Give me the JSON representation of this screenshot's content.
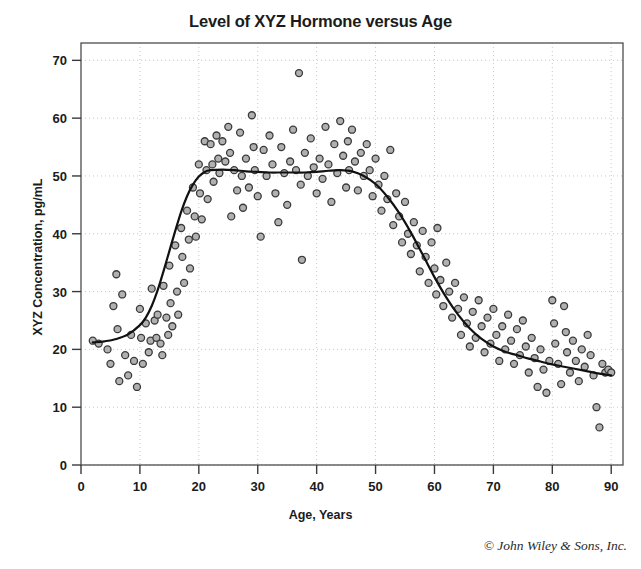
{
  "chart_data": {
    "type": "scatter",
    "title": "Level of XYZ Hormone versus Age",
    "xlabel": "Age, Years",
    "ylabel": "XYZ Concentration, pg/mL",
    "xlim": [
      0,
      92
    ],
    "ylim": [
      0,
      73
    ],
    "xticks": [
      0,
      10,
      20,
      30,
      40,
      50,
      60,
      70,
      80,
      90
    ],
    "yticks": [
      0,
      10,
      20,
      30,
      40,
      50,
      60,
      70
    ],
    "grid": true,
    "legend": "none",
    "marker": {
      "shape": "circle",
      "fill_color": "#b0b0b0",
      "edge_color": "#3a3a3a",
      "size_px": 7
    },
    "series": [
      {
        "name": "XYZ Hormone measurements",
        "type": "scatter",
        "points": [
          [
            2.0,
            21.5
          ],
          [
            3.0,
            21.0
          ],
          [
            4.5,
            20.0
          ],
          [
            5.0,
            17.5
          ],
          [
            5.5,
            27.5
          ],
          [
            6.0,
            33.0
          ],
          [
            6.2,
            23.5
          ],
          [
            6.5,
            14.5
          ],
          [
            7.0,
            29.5
          ],
          [
            7.5,
            19.0
          ],
          [
            8.0,
            15.5
          ],
          [
            8.5,
            22.5
          ],
          [
            9.0,
            18.0
          ],
          [
            9.5,
            13.5
          ],
          [
            10.0,
            27.0
          ],
          [
            10.2,
            22.0
          ],
          [
            10.5,
            17.5
          ],
          [
            11.0,
            24.5
          ],
          [
            11.5,
            19.5
          ],
          [
            11.8,
            21.5
          ],
          [
            12.0,
            30.5
          ],
          [
            12.5,
            25.0
          ],
          [
            12.8,
            22.0
          ],
          [
            13.0,
            26.0
          ],
          [
            13.5,
            21.0
          ],
          [
            13.8,
            19.0
          ],
          [
            14.0,
            31.0
          ],
          [
            14.5,
            25.5
          ],
          [
            14.8,
            22.5
          ],
          [
            15.0,
            34.5
          ],
          [
            15.2,
            28.0
          ],
          [
            15.5,
            24.0
          ],
          [
            16.0,
            38.0
          ],
          [
            16.3,
            30.0
          ],
          [
            16.5,
            26.0
          ],
          [
            17.0,
            41.0
          ],
          [
            17.2,
            36.0
          ],
          [
            17.5,
            31.5
          ],
          [
            18.0,
            44.0
          ],
          [
            18.3,
            39.0
          ],
          [
            18.5,
            34.0
          ],
          [
            19.0,
            48.0
          ],
          [
            19.3,
            43.0
          ],
          [
            19.5,
            39.5
          ],
          [
            20.0,
            52.0
          ],
          [
            20.2,
            47.0
          ],
          [
            20.5,
            42.5
          ],
          [
            21.0,
            56.0
          ],
          [
            21.3,
            51.0
          ],
          [
            21.5,
            46.0
          ],
          [
            22.0,
            55.5
          ],
          [
            22.3,
            52.0
          ],
          [
            22.5,
            49.0
          ],
          [
            23.0,
            57.0
          ],
          [
            23.3,
            53.0
          ],
          [
            23.5,
            50.5
          ],
          [
            24.0,
            56.0
          ],
          [
            24.5,
            52.5
          ],
          [
            25.0,
            58.5
          ],
          [
            25.3,
            54.0
          ],
          [
            25.5,
            43.0
          ],
          [
            26.0,
            51.0
          ],
          [
            26.5,
            47.5
          ],
          [
            27.0,
            57.5
          ],
          [
            27.3,
            50.0
          ],
          [
            27.5,
            44.5
          ],
          [
            28.0,
            53.0
          ],
          [
            28.5,
            48.0
          ],
          [
            29.0,
            60.5
          ],
          [
            29.3,
            55.0
          ],
          [
            29.5,
            51.0
          ],
          [
            30.0,
            46.5
          ],
          [
            30.5,
            39.5
          ],
          [
            31.0,
            54.5
          ],
          [
            31.5,
            50.0
          ],
          [
            32.0,
            57.0
          ],
          [
            32.5,
            52.0
          ],
          [
            33.0,
            47.0
          ],
          [
            33.5,
            42.0
          ],
          [
            34.0,
            55.0
          ],
          [
            34.5,
            50.5
          ],
          [
            35.0,
            45.0
          ],
          [
            35.5,
            52.5
          ],
          [
            36.0,
            58.0
          ],
          [
            36.5,
            51.0
          ],
          [
            37.0,
            67.8
          ],
          [
            37.3,
            48.5
          ],
          [
            37.5,
            35.5
          ],
          [
            38.0,
            54.0
          ],
          [
            38.5,
            50.0
          ],
          [
            39.0,
            56.5
          ],
          [
            39.5,
            51.5
          ],
          [
            40.0,
            47.0
          ],
          [
            40.5,
            53.0
          ],
          [
            41.0,
            49.5
          ],
          [
            41.5,
            58.5
          ],
          [
            42.0,
            52.0
          ],
          [
            42.5,
            45.5
          ],
          [
            43.0,
            55.5
          ],
          [
            43.5,
            50.5
          ],
          [
            44.0,
            59.5
          ],
          [
            44.5,
            53.5
          ],
          [
            45.0,
            48.0
          ],
          [
            45.3,
            56.0
          ],
          [
            45.5,
            51.0
          ],
          [
            46.0,
            58.0
          ],
          [
            46.5,
            52.5
          ],
          [
            47.0,
            47.5
          ],
          [
            47.5,
            54.0
          ],
          [
            48.0,
            50.0
          ],
          [
            48.5,
            55.5
          ],
          [
            49.0,
            51.0
          ],
          [
            49.5,
            46.5
          ],
          [
            50.0,
            53.0
          ],
          [
            50.5,
            48.5
          ],
          [
            51.0,
            44.0
          ],
          [
            51.5,
            50.0
          ],
          [
            52.0,
            46.0
          ],
          [
            52.5,
            54.5
          ],
          [
            53.0,
            41.5
          ],
          [
            53.5,
            47.0
          ],
          [
            54.0,
            43.0
          ],
          [
            54.5,
            38.5
          ],
          [
            55.0,
            45.5
          ],
          [
            55.5,
            40.0
          ],
          [
            56.0,
            36.5
          ],
          [
            56.5,
            42.0
          ],
          [
            57.0,
            38.0
          ],
          [
            57.5,
            33.5
          ],
          [
            58.0,
            40.5
          ],
          [
            58.5,
            36.0
          ],
          [
            59.0,
            31.5
          ],
          [
            59.5,
            38.5
          ],
          [
            60.0,
            34.0
          ],
          [
            60.3,
            29.5
          ],
          [
            60.5,
            41.0
          ],
          [
            61.0,
            32.0
          ],
          [
            61.5,
            27.5
          ],
          [
            62.0,
            35.0
          ],
          [
            62.5,
            30.0
          ],
          [
            63.0,
            25.5
          ],
          [
            63.5,
            31.5
          ],
          [
            64.0,
            27.0
          ],
          [
            64.5,
            22.5
          ],
          [
            65.0,
            29.0
          ],
          [
            65.5,
            24.5
          ],
          [
            66.0,
            20.5
          ],
          [
            66.5,
            26.5
          ],
          [
            67.0,
            22.0
          ],
          [
            67.5,
            28.5
          ],
          [
            68.0,
            24.0
          ],
          [
            68.5,
            19.5
          ],
          [
            69.0,
            25.5
          ],
          [
            69.5,
            21.0
          ],
          [
            70.0,
            27.0
          ],
          [
            70.5,
            22.5
          ],
          [
            71.0,
            18.0
          ],
          [
            71.5,
            24.0
          ],
          [
            72.0,
            20.0
          ],
          [
            72.5,
            26.0
          ],
          [
            73.0,
            21.5
          ],
          [
            73.5,
            17.5
          ],
          [
            74.0,
            23.5
          ],
          [
            74.5,
            19.0
          ],
          [
            75.0,
            25.0
          ],
          [
            75.5,
            20.5
          ],
          [
            76.0,
            16.0
          ],
          [
            76.5,
            22.0
          ],
          [
            77.0,
            18.5
          ],
          [
            77.5,
            13.5
          ],
          [
            78.0,
            20.0
          ],
          [
            78.5,
            16.5
          ],
          [
            79.0,
            12.5
          ],
          [
            79.5,
            18.0
          ],
          [
            80.0,
            28.5
          ],
          [
            80.3,
            24.5
          ],
          [
            80.5,
            21.0
          ],
          [
            81.0,
            17.5
          ],
          [
            81.5,
            14.0
          ],
          [
            82.0,
            27.5
          ],
          [
            82.3,
            23.0
          ],
          [
            82.5,
            19.5
          ],
          [
            83.0,
            16.0
          ],
          [
            83.5,
            21.5
          ],
          [
            84.0,
            18.0
          ],
          [
            84.5,
            14.5
          ],
          [
            85.0,
            20.0
          ],
          [
            85.5,
            17.0
          ],
          [
            86.0,
            22.5
          ],
          [
            86.5,
            19.0
          ],
          [
            87.0,
            15.5
          ],
          [
            87.5,
            10.0
          ],
          [
            88.0,
            6.5
          ],
          [
            88.5,
            17.5
          ],
          [
            89.0,
            16.0
          ],
          [
            89.5,
            16.5
          ],
          [
            90.0,
            16.0
          ]
        ]
      },
      {
        "name": "Fitted trend curve",
        "type": "line",
        "color": "#111111",
        "width_px": 2.2,
        "points": [
          [
            2.0,
            21.2
          ],
          [
            4.0,
            21.4
          ],
          [
            6.0,
            21.8
          ],
          [
            8.0,
            22.6
          ],
          [
            10.0,
            24.2
          ],
          [
            11.0,
            25.5
          ],
          [
            12.0,
            27.5
          ],
          [
            13.0,
            30.2
          ],
          [
            14.0,
            33.5
          ],
          [
            15.0,
            37.0
          ],
          [
            16.0,
            40.5
          ],
          [
            17.0,
            43.8
          ],
          [
            18.0,
            46.5
          ],
          [
            19.0,
            48.5
          ],
          [
            20.0,
            49.9
          ],
          [
            21.0,
            50.7
          ],
          [
            22.0,
            51.0
          ],
          [
            24.0,
            51.1
          ],
          [
            26.0,
            51.0
          ],
          [
            28.0,
            50.8
          ],
          [
            30.0,
            50.7
          ],
          [
            32.0,
            50.6
          ],
          [
            34.0,
            50.6
          ],
          [
            36.0,
            50.6
          ],
          [
            38.0,
            50.6
          ],
          [
            40.0,
            50.7
          ],
          [
            42.0,
            50.9
          ],
          [
            44.0,
            51.0
          ],
          [
            46.0,
            50.8
          ],
          [
            48.0,
            50.0
          ],
          [
            50.0,
            48.6
          ],
          [
            52.0,
            46.4
          ],
          [
            54.0,
            43.6
          ],
          [
            56.0,
            40.2
          ],
          [
            58.0,
            36.4
          ],
          [
            60.0,
            32.5
          ],
          [
            62.0,
            29.0
          ],
          [
            64.0,
            26.0
          ],
          [
            66.0,
            23.6
          ],
          [
            68.0,
            21.8
          ],
          [
            70.0,
            20.5
          ],
          [
            72.0,
            19.6
          ],
          [
            74.0,
            19.0
          ],
          [
            76.0,
            18.4
          ],
          [
            78.0,
            17.9
          ],
          [
            80.0,
            17.4
          ],
          [
            82.0,
            17.0
          ],
          [
            84.0,
            16.6
          ],
          [
            86.0,
            16.2
          ],
          [
            88.0,
            15.8
          ],
          [
            90.0,
            15.5
          ]
        ]
      }
    ]
  },
  "credit": "© John Wiley & Sons, Inc."
}
